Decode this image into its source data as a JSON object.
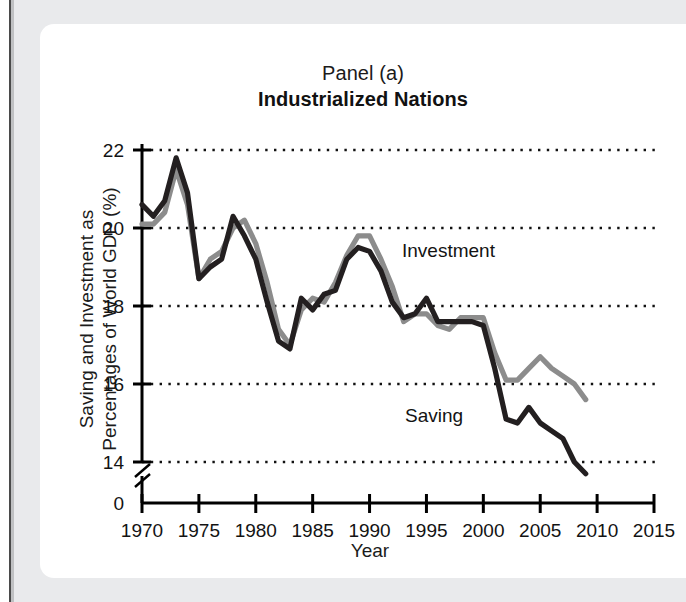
{
  "figure": {
    "panel_label": "Panel (a)",
    "panel_title": "Industrialized Nations"
  },
  "axes": {
    "y_caption_line1": "Saving and Investment as",
    "y_caption_line2": "Percentages of World GDP (%)",
    "x_caption": "Year",
    "y_ticks": [
      "22",
      "20",
      "18",
      "16",
      "14",
      "0"
    ],
    "x_ticks": [
      "1970",
      "1975",
      "1980",
      "1985",
      "1990",
      "1995",
      "2000",
      "2005",
      "2010",
      "2015"
    ],
    "axis_break_present": "true"
  },
  "annotations": {
    "investment_label": "Investment",
    "saving_label": "Saving"
  },
  "colors": {
    "investment_line": "#8c8c8c",
    "saving_line": "#231f20",
    "axis": "#000000",
    "gridline": "#111111",
    "card_background": "#ffffff",
    "page_background": "#e9eaec"
  },
  "chart_data": {
    "type": "line",
    "subtitle": "Industrialized Nations",
    "xlabel": "Year",
    "ylabel": "Saving and Investment as Percentages of World GDP (%)",
    "xlim": [
      1970,
      2015
    ],
    "ylim": [
      14,
      22
    ],
    "y_axis_note": "Axis broken between 0 and 14",
    "grid": "horizontal dotted gridlines at 14, 16, 18, 20, 22",
    "legend": "inline annotations next to each line",
    "x": [
      1970,
      1971,
      1972,
      1973,
      1974,
      1975,
      1976,
      1977,
      1978,
      1979,
      1980,
      1981,
      1982,
      1983,
      1984,
      1985,
      1986,
      1987,
      1988,
      1989,
      1990,
      1991,
      1992,
      1993,
      1994,
      1995,
      1996,
      1997,
      1998,
      1999,
      2000,
      2001,
      2002,
      2003,
      2004,
      2005,
      2006,
      2007,
      2008,
      2009
    ],
    "series": [
      {
        "name": "Investment",
        "color": "#8c8c8c",
        "values": [
          20.1,
          20.1,
          20.4,
          21.5,
          20.6,
          18.7,
          19.2,
          19.4,
          20.0,
          20.2,
          19.6,
          18.6,
          17.4,
          17.0,
          17.9,
          18.2,
          18.1,
          18.6,
          19.3,
          19.8,
          19.8,
          19.2,
          18.5,
          17.6,
          17.8,
          17.8,
          17.5,
          17.4,
          17.7,
          17.7,
          17.7,
          16.8,
          16.1,
          16.1,
          16.4,
          16.7,
          16.4,
          16.2,
          16.0,
          15.6
        ]
      },
      {
        "name": "Saving",
        "color": "#231f20",
        "values": [
          20.6,
          20.3,
          20.7,
          21.8,
          20.9,
          18.7,
          19.0,
          19.2,
          20.3,
          19.8,
          19.2,
          18.1,
          17.1,
          16.9,
          18.2,
          17.9,
          18.3,
          18.4,
          19.2,
          19.5,
          19.4,
          18.9,
          18.1,
          17.7,
          17.8,
          18.2,
          17.6,
          17.6,
          17.6,
          17.6,
          17.5,
          16.4,
          15.1,
          15.0,
          15.4,
          15.0,
          14.8,
          14.6,
          14.0,
          13.7
        ]
      }
    ],
    "annotations": [
      {
        "text": "Investment",
        "x": 1993,
        "y": 19.4
      },
      {
        "text": "Saving",
        "x": 1998,
        "y": 15.1
      }
    ]
  }
}
